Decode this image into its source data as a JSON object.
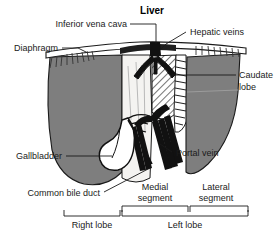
{
  "figure": {
    "title": "Liver",
    "background": "#ffffff",
    "colors": {
      "lobe_gray": "#7e7e7e",
      "lobe_gray_dark": "#6a6a6a",
      "center_pale": "#f2f2f0",
      "vessel_black": "#111111",
      "outline": "#1a1a1a",
      "hatch": "#2a2a2a",
      "text": "#1a1a1a"
    }
  },
  "labels": {
    "title": "Liver",
    "inferior_vena_cava": "Inferior vena cava",
    "hepatic_veins": "Hepatic veins",
    "diaphragm": "Diaphragm",
    "caudate_lobe_line1": "Caudate",
    "caudate_lobe_line2": "lobe",
    "gallbladder": "Gallbladder",
    "portal_vein": "Portal vein",
    "common_bile_duct": "Common bile duct",
    "medial_segment_line1": "Medial",
    "medial_segment_line2": "segment",
    "lateral_segment_line1": "Lateral",
    "lateral_segment_line2": "segment",
    "right_lobe": "Right lobe",
    "left_lobe": "Left lobe"
  },
  "structures": [
    {
      "name": "liver",
      "kind": "organ",
      "label": "Liver"
    },
    {
      "name": "inferior-vena-cava",
      "kind": "vessel",
      "label": "Inferior vena cava"
    },
    {
      "name": "hepatic-veins",
      "kind": "vessel",
      "label": "Hepatic veins"
    },
    {
      "name": "diaphragm",
      "kind": "muscle",
      "label": "Diaphragm"
    },
    {
      "name": "caudate-lobe",
      "kind": "lobe",
      "label": "Caudate lobe"
    },
    {
      "name": "gallbladder",
      "kind": "organ",
      "label": "Gallbladder"
    },
    {
      "name": "portal-vein",
      "kind": "vessel",
      "label": "Portal vein"
    },
    {
      "name": "common-bile-duct",
      "kind": "duct",
      "label": "Common bile duct"
    },
    {
      "name": "medial-segment",
      "kind": "segment",
      "label": "Medial segment"
    },
    {
      "name": "lateral-segment",
      "kind": "segment",
      "label": "Lateral segment"
    },
    {
      "name": "right-lobe",
      "kind": "lobe",
      "label": "Right lobe"
    },
    {
      "name": "left-lobe",
      "kind": "lobe",
      "label": "Left lobe"
    }
  ]
}
